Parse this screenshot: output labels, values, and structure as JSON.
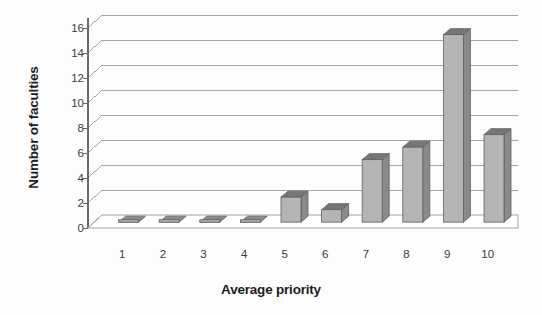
{
  "chart_data": {
    "type": "bar",
    "title": "",
    "xlabel": "Average priority",
    "ylabel": "Number of faculties",
    "categories": [
      "1",
      "2",
      "3",
      "4",
      "5",
      "6",
      "7",
      "8",
      "9",
      "10"
    ],
    "values": [
      0,
      0,
      0,
      0,
      2,
      1,
      5,
      6,
      15,
      7
    ],
    "series": [
      {
        "name": "Number of faculties",
        "values": [
          0,
          0,
          0,
          0,
          2,
          1,
          5,
          6,
          15,
          7
        ]
      }
    ],
    "ylim": [
      0,
      16
    ],
    "ytick_labels": [
      "0",
      "2",
      "4",
      "6",
      "8",
      "10",
      "12",
      "14",
      "16"
    ],
    "ytick_values": [
      0,
      2,
      4,
      6,
      8,
      10,
      12,
      14,
      16
    ],
    "grid": true,
    "grid_axis": "y",
    "legend": false,
    "legend_position": "none",
    "style": "3d-column",
    "colors": {
      "bar_front": "#b4b4b4",
      "bar_side": "#8a8a8a",
      "bar_top": "#767676",
      "bar_outline": "#5e5e5e",
      "grid_line": "#9a9a9a",
      "axis_line": "#6b6b6b",
      "floor": "#ffffff",
      "text": "#2b2b2b",
      "background": "#ffffff"
    }
  },
  "axes": {
    "y_title": "Number of faculties",
    "x_title": "Average priority"
  }
}
